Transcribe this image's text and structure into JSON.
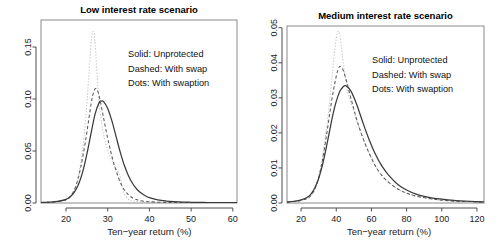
{
  "figure": {
    "background": "#ffffff",
    "panel_count": 2,
    "legend_lines": [
      "Solid: Unprotected",
      "Dashed: With swap",
      "Dots: With swaption"
    ]
  },
  "chart_data": [
    {
      "type": "line",
      "panel": "left",
      "title": "Low interest rate scenario",
      "xlabel": "Ten−year return (%)",
      "ylabel": "",
      "xlim": [
        14,
        61
      ],
      "ylim": [
        0,
        0.176
      ],
      "xticks": [
        20,
        30,
        40,
        50,
        60
      ],
      "xtick_labels": [
        "20",
        "30",
        "40",
        "50",
        "60"
      ],
      "yticks": [
        0.0,
        0.05,
        0.1,
        0.15
      ],
      "ytick_labels": [
        "0.00",
        "0.05",
        "0.10",
        "0.15"
      ],
      "grid": false,
      "legend_position": "upper-right-inside",
      "series": [
        {
          "name": "Unprotected",
          "style": "solid",
          "color": "#3a3a3a",
          "peak_x": 28.5,
          "peak_y": 0.098,
          "x": [
            14,
            16,
            18,
            20,
            21,
            22,
            23,
            24,
            25,
            26,
            27,
            28,
            28.5,
            29,
            30,
            31,
            32,
            33,
            34,
            35,
            36,
            37,
            38,
            39,
            40,
            42,
            44,
            46,
            48,
            50,
            53,
            56,
            61
          ],
          "y": [
            0.0005,
            0.0008,
            0.0015,
            0.0035,
            0.006,
            0.0105,
            0.018,
            0.03,
            0.047,
            0.067,
            0.086,
            0.097,
            0.098,
            0.0975,
            0.091,
            0.079,
            0.064,
            0.049,
            0.036,
            0.026,
            0.0185,
            0.0132,
            0.0095,
            0.007,
            0.0052,
            0.003,
            0.0019,
            0.0013,
            0.0009,
            0.0007,
            0.0005,
            0.0004,
            0.0003
          ]
        },
        {
          "name": "With swap",
          "style": "dashed",
          "color": "#5a5a5a",
          "peak_x": 27.0,
          "peak_y": 0.11,
          "x": [
            14,
            16,
            18,
            20,
            21,
            22,
            23,
            24,
            25,
            26,
            26.5,
            27,
            27.5,
            28,
            29,
            30,
            31,
            32,
            33,
            34,
            35,
            36,
            37,
            38,
            39,
            40,
            42,
            44,
            46,
            50,
            55,
            61
          ],
          "y": [
            0.0004,
            0.0007,
            0.0013,
            0.0032,
            0.0062,
            0.0125,
            0.025,
            0.044,
            0.068,
            0.095,
            0.105,
            0.11,
            0.1085,
            0.102,
            0.082,
            0.062,
            0.045,
            0.031,
            0.02,
            0.0125,
            0.0078,
            0.0048,
            0.0032,
            0.0022,
            0.0016,
            0.0012,
            0.0008,
            0.0006,
            0.0005,
            0.0004,
            0.0003,
            0.0002
          ]
        },
        {
          "name": "With swaption",
          "style": "dotted",
          "color": "#b9b9b9",
          "peak_x": 26.5,
          "peak_y": 0.165,
          "x": [
            14,
            16,
            18,
            20,
            21,
            22,
            23,
            24,
            25,
            25.5,
            26,
            26.3,
            26.5,
            26.8,
            27,
            27.5,
            28,
            29,
            30,
            31,
            32,
            32.5,
            33,
            33.5,
            34,
            35,
            36,
            38,
            40,
            44,
            50,
            55,
            61
          ],
          "y": [
            0.0004,
            0.0007,
            0.0013,
            0.0032,
            0.0062,
            0.0128,
            0.027,
            0.052,
            0.095,
            0.125,
            0.153,
            0.163,
            0.165,
            0.162,
            0.152,
            0.12,
            0.093,
            0.066,
            0.051,
            0.041,
            0.033,
            0.03,
            0.025,
            0.016,
            0.009,
            0.0035,
            0.002,
            0.0012,
            0.0009,
            0.0006,
            0.0004,
            0.0003,
            0.0002
          ]
        }
      ]
    },
    {
      "type": "line",
      "panel": "right",
      "title": "Medium interest rate scenario",
      "xlabel": "Ten−year return (%)",
      "ylabel": "",
      "xlim": [
        12,
        124
      ],
      "ylim": [
        0,
        0.0505
      ],
      "xticks": [
        20,
        40,
        60,
        80,
        100,
        120
      ],
      "xtick_labels": [
        "20",
        "40",
        "60",
        "80",
        "100",
        "120"
      ],
      "yticks": [
        0.0,
        0.01,
        0.02,
        0.03,
        0.04,
        0.05
      ],
      "ytick_labels": [
        "0.00",
        "0.01",
        "0.02",
        "0.03",
        "0.04",
        "0.05"
      ],
      "grid": false,
      "legend_position": "upper-right-inside",
      "series": [
        {
          "name": "Unprotected",
          "style": "solid",
          "color": "#3a3a3a",
          "peak_x": 45.0,
          "peak_y": 0.0335,
          "x": [
            12,
            16,
            20,
            24,
            26,
            28,
            30,
            32,
            34,
            36,
            38,
            40,
            42,
            44,
            45,
            46,
            48,
            50,
            52,
            55,
            58,
            62,
            66,
            70,
            75,
            80,
            85,
            90,
            95,
            100,
            108,
            116,
            124
          ],
          "y": [
            0.0003,
            0.0005,
            0.0009,
            0.0018,
            0.0028,
            0.0045,
            0.007,
            0.0105,
            0.015,
            0.02,
            0.025,
            0.029,
            0.0318,
            0.0332,
            0.0335,
            0.0333,
            0.0322,
            0.0302,
            0.0276,
            0.0232,
            0.019,
            0.0142,
            0.0105,
            0.0078,
            0.0053,
            0.0037,
            0.0026,
            0.0019,
            0.0014,
            0.0011,
            0.0007,
            0.0005,
            0.0003
          ]
        },
        {
          "name": "With swap",
          "style": "dashed",
          "color": "#5a5a5a",
          "peak_x": 42.0,
          "peak_y": 0.039,
          "x": [
            12,
            16,
            20,
            24,
            26,
            28,
            30,
            32,
            34,
            36,
            38,
            40,
            41,
            42,
            43,
            44,
            46,
            48,
            50,
            52,
            55,
            58,
            62,
            66,
            70,
            75,
            80,
            85,
            90,
            95,
            100,
            108,
            116,
            124
          ],
          "y": [
            0.0002,
            0.0004,
            0.0007,
            0.0014,
            0.0024,
            0.0042,
            0.0072,
            0.0118,
            0.0178,
            0.0245,
            0.031,
            0.0362,
            0.038,
            0.039,
            0.0387,
            0.0378,
            0.0345,
            0.0305,
            0.0268,
            0.0232,
            0.0188,
            0.015,
            0.0108,
            0.0078,
            0.0058,
            0.004,
            0.0028,
            0.002,
            0.0015,
            0.0011,
            0.0008,
            0.0005,
            0.0004,
            0.0002
          ]
        },
        {
          "name": "With swaption",
          "style": "dotted",
          "color": "#b9b9b9",
          "peak_x": 41.0,
          "peak_y": 0.049,
          "x": [
            12,
            16,
            20,
            24,
            26,
            28,
            30,
            32,
            34,
            36,
            38,
            39,
            40,
            41,
            42,
            43,
            44,
            46,
            48,
            50,
            52,
            55,
            58,
            62,
            66,
            70,
            75,
            80,
            85,
            90,
            95,
            100,
            108,
            116,
            124
          ],
          "y": [
            0.0002,
            0.0004,
            0.0007,
            0.0014,
            0.0024,
            0.0042,
            0.0074,
            0.0125,
            0.0195,
            0.028,
            0.038,
            0.043,
            0.047,
            0.049,
            0.048,
            0.0445,
            0.04,
            0.033,
            0.029,
            0.0262,
            0.023,
            0.0188,
            0.015,
            0.0108,
            0.0078,
            0.0058,
            0.004,
            0.0028,
            0.002,
            0.0015,
            0.0011,
            0.0008,
            0.0005,
            0.0004,
            0.0002
          ]
        }
      ]
    }
  ]
}
